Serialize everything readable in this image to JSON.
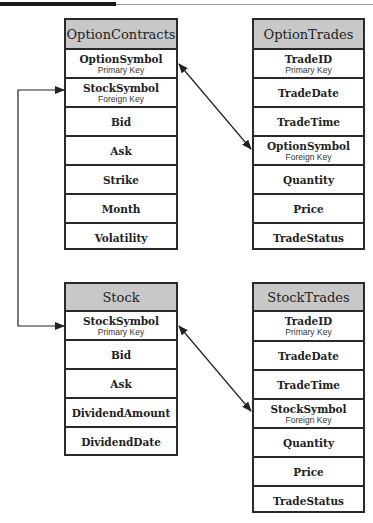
{
  "diagram": {
    "tables": {
      "option_contracts": {
        "title": "OptionContracts",
        "fields": [
          {
            "name": "OptionSymbol",
            "key": "Primary Key"
          },
          {
            "name": "StockSymbol",
            "key": "Foreign Key"
          },
          {
            "name": "Bid",
            "key": ""
          },
          {
            "name": "Ask",
            "key": ""
          },
          {
            "name": "Strike",
            "key": ""
          },
          {
            "name": "Month",
            "key": ""
          },
          {
            "name": "Volatility",
            "key": ""
          }
        ]
      },
      "option_trades": {
        "title": "OptionTrades",
        "fields": [
          {
            "name": "TradeID",
            "key": "Primary Key"
          },
          {
            "name": "TradeDate",
            "key": ""
          },
          {
            "name": "TradeTime",
            "key": ""
          },
          {
            "name": "OptionSymbol",
            "key": "Foreign Key"
          },
          {
            "name": "Quantity",
            "key": ""
          },
          {
            "name": "Price",
            "key": ""
          },
          {
            "name": "TradeStatus",
            "key": ""
          }
        ]
      },
      "stock": {
        "title": "Stock",
        "fields": [
          {
            "name": "StockSymbol",
            "key": "Primary Key"
          },
          {
            "name": "Bid",
            "key": ""
          },
          {
            "name": "Ask",
            "key": ""
          },
          {
            "name": "DividendAmount",
            "key": ""
          },
          {
            "name": "DividendDate",
            "key": ""
          }
        ]
      },
      "stock_trades": {
        "title": "StockTrades",
        "fields": [
          {
            "name": "TradeID",
            "key": "Primary Key"
          },
          {
            "name": "TradeDate",
            "key": ""
          },
          {
            "name": "TradeTime",
            "key": ""
          },
          {
            "name": "StockSymbol",
            "key": "Foreign Key"
          },
          {
            "name": "Quantity",
            "key": ""
          },
          {
            "name": "Price",
            "key": ""
          },
          {
            "name": "TradeStatus",
            "key": ""
          }
        ]
      }
    },
    "relationships": [
      {
        "from": "OptionContracts.StockSymbol",
        "to": "Stock.StockSymbol"
      },
      {
        "from": "OptionContracts.OptionSymbol",
        "to": "OptionTrades.OptionSymbol"
      },
      {
        "from": "Stock.StockSymbol",
        "to": "StockTrades.StockSymbol"
      }
    ],
    "colors": {
      "header_fill": "#c8c8c8",
      "border": "#2a2a2a",
      "line": "#222222"
    }
  }
}
